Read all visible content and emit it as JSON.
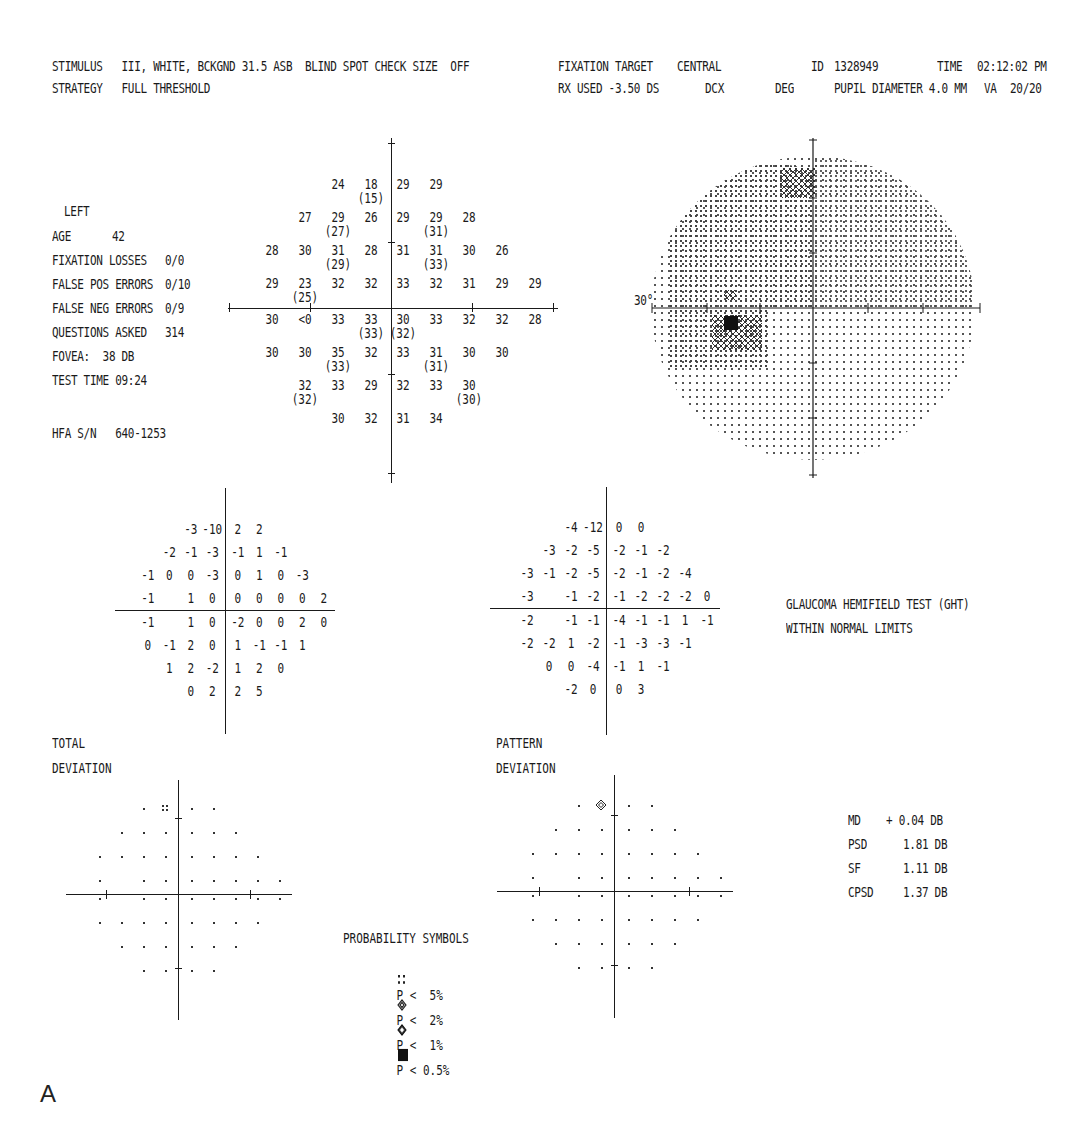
{
  "header": {
    "line1_left": "STIMULUS   III, WHITE, BCKGND 31.5 ASB  BLIND SPOT CHECK SIZE  OFF",
    "line2_left": "STRATEGY   FULL THRESHOLD",
    "fixation_target_label": "FIXATION TARGET",
    "fixation_target_value": "CENTRAL",
    "id_label": "ID",
    "id_value": "1328949",
    "time_label": "TIME",
    "time_value": "02:12:02 PM",
    "rx_used": "RX USED -3.50 DS",
    "dcx": "DCX",
    "deg": "DEG",
    "pupil_diameter": "PUPIL DIAMETER 4.0 MM",
    "va_label": "VA",
    "va_value": "20/20"
  },
  "patient": {
    "eye": "LEFT",
    "age_label": "AGE",
    "age_value": "42",
    "fixation_losses_label": "FIXATION LOSSES",
    "fixation_losses_value": "0/0",
    "false_pos_label": "FALSE POS ERRORS",
    "false_pos_value": "0/10",
    "false_neg_label": "FALSE NEG ERRORS",
    "false_neg_value": "0/9",
    "questions_label": "QUESTIONS ASKED",
    "questions_value": "314",
    "fovea": "FOVEA:  38 DB",
    "test_time": "TEST TIME 09:24",
    "hfa_sn": "HFA S/N   640-1253"
  },
  "threshold": {
    "cells": [
      {
        "c": -2,
        "r": -4,
        "v": "24"
      },
      {
        "c": -1,
        "r": -4,
        "v": "18",
        "s": "(15)"
      },
      {
        "c": 1,
        "r": -4,
        "v": "29"
      },
      {
        "c": 2,
        "r": -4,
        "v": "29"
      },
      {
        "c": -3,
        "r": -3,
        "v": "27"
      },
      {
        "c": -2,
        "r": -3,
        "v": "29",
        "s": "(27)"
      },
      {
        "c": -1,
        "r": -3,
        "v": "26"
      },
      {
        "c": 1,
        "r": -3,
        "v": "29"
      },
      {
        "c": 2,
        "r": -3,
        "v": "29",
        "s": "(31)"
      },
      {
        "c": 3,
        "r": -3,
        "v": "28"
      },
      {
        "c": -4,
        "r": -2,
        "v": "28"
      },
      {
        "c": -3,
        "r": -2,
        "v": "30"
      },
      {
        "c": -2,
        "r": -2,
        "v": "31",
        "s": "(29)"
      },
      {
        "c": -1,
        "r": -2,
        "v": "28"
      },
      {
        "c": 1,
        "r": -2,
        "v": "31"
      },
      {
        "c": 2,
        "r": -2,
        "v": "31",
        "s": "(33)"
      },
      {
        "c": 3,
        "r": -2,
        "v": "30"
      },
      {
        "c": 4,
        "r": -2,
        "v": "26"
      },
      {
        "c": -4,
        "r": -1,
        "v": "29"
      },
      {
        "c": -3,
        "r": -1,
        "v": "23",
        "s": "(25)"
      },
      {
        "c": -2,
        "r": -1,
        "v": "32"
      },
      {
        "c": -1,
        "r": -1,
        "v": "32"
      },
      {
        "c": 1,
        "r": -1,
        "v": "33"
      },
      {
        "c": 2,
        "r": -1,
        "v": "32"
      },
      {
        "c": 3,
        "r": -1,
        "v": "31"
      },
      {
        "c": 4,
        "r": -1,
        "v": "29"
      },
      {
        "c": 5,
        "r": -1,
        "v": "29"
      },
      {
        "c": -4,
        "r": 1,
        "v": "30"
      },
      {
        "c": -3,
        "r": 1,
        "v": "<0"
      },
      {
        "c": -2,
        "r": 1,
        "v": "33"
      },
      {
        "c": -1,
        "r": 1,
        "v": "33",
        "s": "(33)"
      },
      {
        "c": 1,
        "r": 1,
        "v": "30",
        "s": "(32)"
      },
      {
        "c": 2,
        "r": 1,
        "v": "33"
      },
      {
        "c": 3,
        "r": 1,
        "v": "32"
      },
      {
        "c": 4,
        "r": 1,
        "v": "32"
      },
      {
        "c": 5,
        "r": 1,
        "v": "28"
      },
      {
        "c": -4,
        "r": 2,
        "v": "30"
      },
      {
        "c": -3,
        "r": 2,
        "v": "30"
      },
      {
        "c": -2,
        "r": 2,
        "v": "35",
        "s": "(33)"
      },
      {
        "c": -1,
        "r": 2,
        "v": "32"
      },
      {
        "c": 1,
        "r": 2,
        "v": "33"
      },
      {
        "c": 2,
        "r": 2,
        "v": "31",
        "s": "(31)"
      },
      {
        "c": 3,
        "r": 2,
        "v": "30"
      },
      {
        "c": 4,
        "r": 2,
        "v": "30"
      },
      {
        "c": -3,
        "r": 3,
        "v": "32",
        "s": "(32)"
      },
      {
        "c": -2,
        "r": 3,
        "v": "33"
      },
      {
        "c": -1,
        "r": 3,
        "v": "29"
      },
      {
        "c": 1,
        "r": 3,
        "v": "32"
      },
      {
        "c": 2,
        "r": 3,
        "v": "33"
      },
      {
        "c": 3,
        "r": 3,
        "v": "30",
        "s": "(30)"
      },
      {
        "c": -2,
        "r": 4,
        "v": "30"
      },
      {
        "c": -1,
        "r": 4,
        "v": "32"
      },
      {
        "c": 1,
        "r": 4,
        "v": "31"
      },
      {
        "c": 2,
        "r": 4,
        "v": "34"
      }
    ]
  },
  "grayscale": {
    "label_30deg": "30°"
  },
  "total_deviation_values": [
    [
      "",
      "",
      "-3",
      "-10",
      "2",
      "2",
      "",
      "",
      ""
    ],
    [
      "",
      "-2",
      "-1",
      "-3",
      "-1",
      "1",
      "-1",
      "",
      ""
    ],
    [
      "-1",
      "0",
      "0",
      "-3",
      "0",
      "1",
      "0",
      "-3",
      ""
    ],
    [
      "-1",
      "",
      "1",
      "0",
      "0",
      "0",
      "0",
      "0",
      "2"
    ],
    [
      "-1",
      "",
      "1",
      "0",
      "-2",
      "0",
      "0",
      "2",
      "0"
    ],
    [
      "0",
      "-1",
      "2",
      "0",
      "1",
      "-1",
      "-1",
      "1",
      ""
    ],
    [
      "",
      "1",
      "2",
      "-2",
      "1",
      "2",
      "0",
      "",
      ""
    ],
    [
      "",
      "",
      "0",
      "2",
      "2",
      "5",
      "",
      "",
      ""
    ]
  ],
  "pattern_deviation_values": [
    [
      "",
      "",
      "-4",
      "-12",
      "0",
      "0",
      "",
      "",
      ""
    ],
    [
      "",
      "-3",
      "-2",
      "-5",
      "-2",
      "-1",
      "-2",
      "",
      ""
    ],
    [
      "-3",
      "-1",
      "-2",
      "-5",
      "-2",
      "-1",
      "-2",
      "-4",
      ""
    ],
    [
      "-3",
      "",
      "-1",
      "-2",
      "-1",
      "-2",
      "-2",
      "-2",
      "0"
    ],
    [
      "-2",
      "",
      "-1",
      "-1",
      "-4",
      "-1",
      "-1",
      "1",
      "-1"
    ],
    [
      "-2",
      "-2",
      "1",
      "-2",
      "-1",
      "-3",
      "-3",
      "-1",
      ""
    ],
    [
      "",
      "0",
      "0",
      "-4",
      "-1",
      "1",
      "-1",
      "",
      ""
    ],
    [
      "",
      "",
      "-2",
      "0",
      "0",
      "3",
      "",
      "",
      ""
    ]
  ],
  "ght": {
    "title": "GLAUCOMA HEMIFIELD TEST (GHT)",
    "result": "WITHIN NORMAL LIMITS"
  },
  "plots": {
    "total_label_1": "TOTAL",
    "total_label_2": "DEVIATION",
    "pattern_label_1": "PATTERN",
    "pattern_label_2": "DEVIATION"
  },
  "legend": {
    "title": "PROBABILITY SYMBOLS",
    "items": [
      {
        "icon": "dots-4",
        "text": "P <  5%"
      },
      {
        "icon": "checker-light",
        "text": "P <  2%"
      },
      {
        "icon": "checker-dark",
        "text": "P <  1%"
      },
      {
        "icon": "solid-square",
        "text": "P < 0.5%"
      }
    ]
  },
  "indices": {
    "md_label": "MD",
    "md_value": "+ 0.04 DB",
    "psd_label": "PSD",
    "psd_value": "1.81 DB",
    "sf_label": "SF",
    "sf_value": "1.11 DB",
    "cpsd_label": "CPSD",
    "cpsd_value": "1.37 DB"
  },
  "figure_label": "A"
}
